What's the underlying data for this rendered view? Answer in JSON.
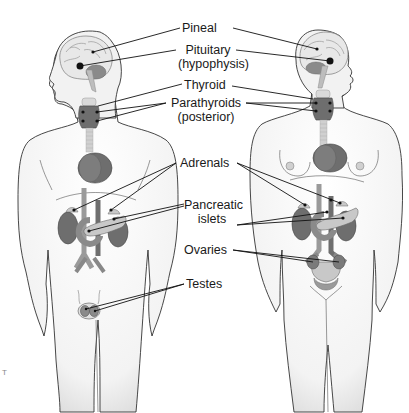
{
  "diagram": {
    "figures": [
      {
        "id": "male",
        "name": "Male figure"
      },
      {
        "id": "female",
        "name": "Female figure"
      }
    ],
    "labels": {
      "pineal": "Pineal",
      "pituitary": "Pituitary",
      "pituitary_alt": "(hypophysis)",
      "thyroid": "Thyroid",
      "parathyroids": "Parathyroids",
      "parathyroids_note": "(posterior)",
      "adrenals": "Adrenals",
      "pancreatic": "Pancreatic",
      "pancreatic_2": "islets",
      "ovaries": "Ovaries",
      "testes": "Testes"
    },
    "corner_mark": "T",
    "colors": {
      "body_fill": "#f4f4f4",
      "outline": "#333333",
      "organ_dark": "#6e6e6e",
      "organ_mid": "#9a9a9a",
      "organ_light": "#c8c8c8",
      "leader_line": "#111111"
    }
  }
}
